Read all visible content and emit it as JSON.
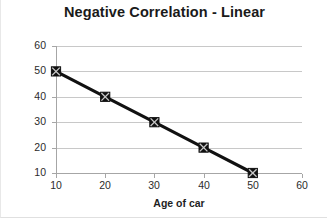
{
  "chart_data": {
    "type": "line",
    "title": "Negative Correlation - Linear",
    "xlabel": "Age of car",
    "ylabel": "Value of Car",
    "x": [
      10,
      20,
      30,
      40,
      50
    ],
    "values": [
      50,
      40,
      30,
      20,
      10
    ],
    "series": [
      {
        "name": "Value of Car",
        "x": [
          10,
          20,
          30,
          40,
          50
        ],
        "values": [
          50,
          40,
          30,
          20,
          10
        ]
      }
    ],
    "xlim": [
      10,
      60
    ],
    "ylim": [
      10,
      60
    ],
    "x_ticks": [
      10,
      20,
      30,
      40,
      50,
      60
    ],
    "y_ticks": [
      10,
      20,
      30,
      40,
      50,
      60
    ],
    "x_tick_labels": [
      "10",
      "20",
      "30",
      "40",
      "50",
      "60"
    ],
    "y_tick_labels": [
      "10",
      "20",
      "30",
      "40",
      "50",
      "60"
    ],
    "grid": "horizontal",
    "legend": "none",
    "marker": "square-with-x",
    "line_color": "#111111",
    "marker_color": "#111111",
    "grid_color": "#c8c8c8",
    "axis_color": "#a6a6a6"
  }
}
